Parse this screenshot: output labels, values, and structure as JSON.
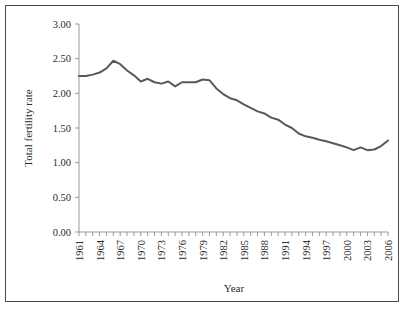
{
  "chart_data": {
    "type": "line",
    "title": "",
    "xlabel": "Year",
    "ylabel": "Total fertility rate",
    "xlim": [
      1961,
      2006
    ],
    "ylim": [
      0.0,
      3.0
    ],
    "ytick_step": 0.5,
    "ytick_labels": [
      "0.00",
      "0.50",
      "1.00",
      "1.50",
      "2.00",
      "2.50",
      "3.00"
    ],
    "ytick_values": [
      0.0,
      0.5,
      1.0,
      1.5,
      2.0,
      2.5,
      3.0
    ],
    "xtick_labels": [
      "1961",
      "1964",
      "1967",
      "1970",
      "1973",
      "1976",
      "1979",
      "1982",
      "1985",
      "1988",
      "1991",
      "1994",
      "1997",
      "2000",
      "2003",
      "2006"
    ],
    "xtick_label_interval": 3,
    "xtick_minor_interval": 1,
    "grid": false,
    "legend": "none",
    "line_color": "#595959",
    "line_width": 2,
    "x": [
      1961,
      1962,
      1963,
      1964,
      1965,
      1966,
      1967,
      1968,
      1969,
      1970,
      1971,
      1972,
      1973,
      1974,
      1975,
      1976,
      1977,
      1978,
      1979,
      1980,
      1981,
      1982,
      1983,
      1984,
      1985,
      1986,
      1987,
      1988,
      1989,
      1990,
      1991,
      1992,
      1993,
      1994,
      1995,
      1996,
      1997,
      1998,
      1999,
      2000,
      2001,
      2002,
      2003,
      2004,
      2005,
      2006
    ],
    "values": [
      2.25,
      2.25,
      2.27,
      2.3,
      2.36,
      2.47,
      2.42,
      2.33,
      2.26,
      2.17,
      2.21,
      2.16,
      2.14,
      2.17,
      2.1,
      2.16,
      2.16,
      2.16,
      2.2,
      2.19,
      2.07,
      1.99,
      1.93,
      1.9,
      1.84,
      1.79,
      1.74,
      1.71,
      1.65,
      1.62,
      1.55,
      1.5,
      1.42,
      1.38,
      1.36,
      1.33,
      1.31,
      1.28,
      1.25,
      1.22,
      1.18,
      1.22,
      1.18,
      1.19,
      1.24,
      1.32
    ],
    "series": [
      {
        "name": "Total fertility rate",
        "values": [
          2.25,
          2.25,
          2.27,
          2.3,
          2.36,
          2.47,
          2.42,
          2.33,
          2.26,
          2.17,
          2.21,
          2.16,
          2.14,
          2.17,
          2.1,
          2.16,
          2.16,
          2.16,
          2.2,
          2.19,
          2.07,
          1.99,
          1.93,
          1.9,
          1.84,
          1.79,
          1.74,
          1.71,
          1.65,
          1.62,
          1.55,
          1.5,
          1.42,
          1.38,
          1.36,
          1.33,
          1.31,
          1.28,
          1.25,
          1.22,
          1.18,
          1.22,
          1.18,
          1.19,
          1.24,
          1.32
        ]
      }
    ]
  }
}
